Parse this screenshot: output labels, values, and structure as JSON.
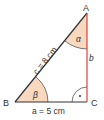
{
  "diagram": {
    "type": "right-triangle",
    "vertices": {
      "A": {
        "label": "A"
      },
      "B": {
        "label": "B"
      },
      "C": {
        "label": "C"
      }
    },
    "sides": {
      "hypotenuse": {
        "label": "c = 8 cm"
      },
      "base": {
        "label": "a = 5 cm"
      },
      "vertical": {
        "label": "b"
      }
    },
    "angles": {
      "alpha": {
        "label": "α"
      },
      "beta": {
        "label": "β"
      },
      "right_angle_marker": "·"
    },
    "colors": {
      "angle_fill": "#f8d8bf",
      "vertical_side": "#e0403a",
      "sides": "#333333",
      "text": "#333333"
    }
  }
}
